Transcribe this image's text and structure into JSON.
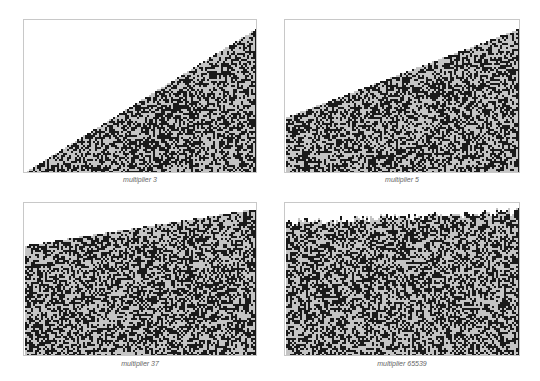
{
  "figure": {
    "colors": {
      "dark": "#1a1a1a",
      "light": "#c4c4c4",
      "background": "#ffffff",
      "border": "#c8c8c8",
      "caption": "#666666"
    },
    "panels": [
      {
        "id": "p3",
        "caption": "multiplier 3",
        "multiplier": 3,
        "left_start_frac": 1.0,
        "right_start_frac": 0.06,
        "rough_top": false
      },
      {
        "id": "p5",
        "caption": "multiplier 5",
        "multiplier": 5,
        "left_start_frac": 0.64,
        "right_start_frac": 0.06,
        "rough_top": false
      },
      {
        "id": "p37",
        "caption": "multiplier 37",
        "multiplier": 37,
        "left_start_frac": 0.28,
        "right_start_frac": 0.04,
        "rough_top": false
      },
      {
        "id": "p65539",
        "caption": "multiplier 65539",
        "multiplier": 65539,
        "left_start_frac": 0.1,
        "right_start_frac": 0.03,
        "rough_top": true
      }
    ]
  }
}
